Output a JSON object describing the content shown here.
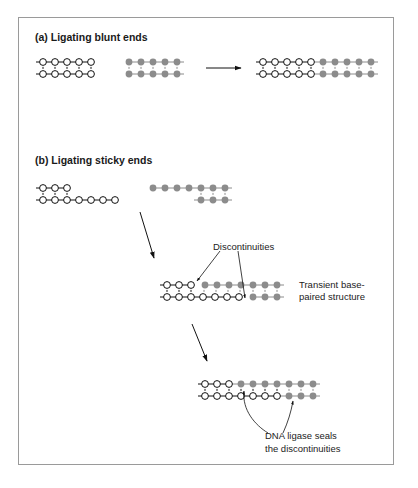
{
  "panel_a": {
    "title": "(a) Ligating blunt ends",
    "left_fragment": {
      "top_strand": 5,
      "bottom_strand": 5,
      "style": "open-circle"
    },
    "right_fragment": {
      "top_strand": 5,
      "bottom_strand": 5,
      "style": "filled-gray"
    },
    "product": {
      "open": 5,
      "filled": 5
    }
  },
  "panel_b": {
    "title": "(b) Ligating sticky ends",
    "left_fragment": {
      "top_strand": 3,
      "bottom_strand": 7,
      "style": "open-circle"
    },
    "right_fragment": {
      "top_strand": 7,
      "bottom_strand": 3,
      "style": "filled-gray"
    },
    "intermediate_label_line1": "Transient base-",
    "intermediate_label_line2": "paired structure",
    "discontinuities_label": "Discontinuities",
    "ligase_label_line1": "DNA ligase seals",
    "ligase_label_line2": "the discontinuities"
  },
  "colors": {
    "open_node_stroke": "#111111",
    "filled_node": "#8c8c8c",
    "frame_border": "#9a9a9a"
  }
}
